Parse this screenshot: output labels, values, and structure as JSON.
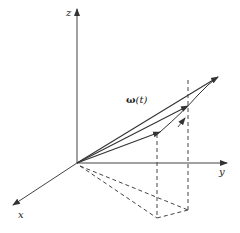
{
  "diagram": {
    "type": "3d-vector-diagram",
    "axes": {
      "x": {
        "label": "x"
      },
      "y": {
        "label": "y"
      },
      "z": {
        "label": "z"
      }
    },
    "vector_label": {
      "symbol": "ω",
      "argument": "(t)"
    },
    "colors": {
      "stroke": "#333333",
      "background": "#ffffff"
    }
  }
}
